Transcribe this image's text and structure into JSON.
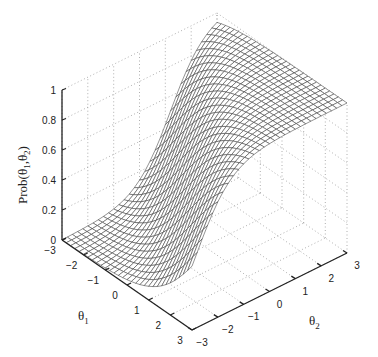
{
  "chart_data": {
    "type": "surface3d",
    "title": "",
    "model": "compensatory two-dimensional logistic: Prob = 1/(1+exp(-(a1*theta1 + a2*theta2 + d)))",
    "params": {
      "a1": 1.0,
      "a2": 1.5,
      "d": 1.2
    },
    "x": {
      "label": "θ",
      "label_sub": "1",
      "range": [
        -3,
        3
      ],
      "ticks": [
        -3,
        -2,
        -1,
        0,
        1,
        2,
        3
      ]
    },
    "y": {
      "label": "θ",
      "label_sub": "2",
      "range": [
        -3,
        3
      ],
      "ticks": [
        -3,
        -2,
        -1,
        0,
        1,
        2,
        3
      ]
    },
    "z": {
      "label": "Prob(θ",
      "label_sub1": "1",
      "label_mid": ",θ",
      "label_sub2": "2",
      "label_end": ")",
      "range": [
        0,
        1
      ],
      "ticks": [
        0,
        0.2,
        0.4,
        0.6,
        0.8,
        1
      ]
    },
    "mesh_step": 0.2,
    "grid": true,
    "legend": "none"
  }
}
